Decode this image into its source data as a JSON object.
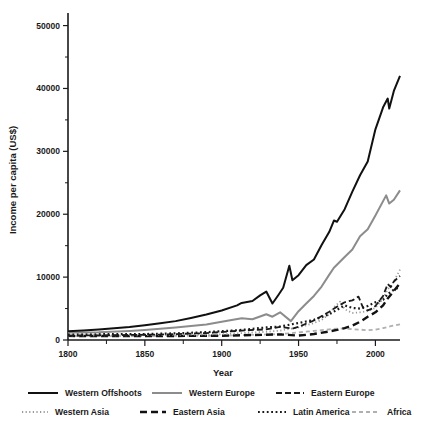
{
  "chart_data": {
    "type": "line",
    "title": "",
    "xlabel": "Year",
    "ylabel": "Income per capita (US$)",
    "xlim": [
      1800,
      2016
    ],
    "ylim": [
      0,
      52000
    ],
    "xticks": [
      1800,
      1850,
      1900,
      1950,
      2000
    ],
    "xtick_labels": [
      "1800",
      "1850",
      "1900",
      "1950",
      "2000"
    ],
    "xticks_minor": [
      1825,
      1875,
      1925,
      1975
    ],
    "yticks": [
      0,
      10000,
      20000,
      30000,
      40000,
      50000
    ],
    "ytick_labels": [
      "0",
      "10000",
      "20000",
      "30000",
      "40000",
      "50000"
    ],
    "yticks_minor": [
      5000,
      15000,
      25000,
      35000,
      45000
    ],
    "grid": false,
    "legend_position": "below",
    "series": [
      {
        "name": "Western Offshoots",
        "color": "#111111",
        "width": 2.0,
        "dash": "none",
        "x": [
          1800,
          1810,
          1820,
          1830,
          1840,
          1850,
          1860,
          1870,
          1880,
          1890,
          1900,
          1910,
          1913,
          1920,
          1925,
          1929,
          1933,
          1937,
          1940,
          1944,
          1946,
          1950,
          1955,
          1960,
          1965,
          1970,
          1973,
          1975,
          1980,
          1985,
          1990,
          1995,
          2000,
          2005,
          2008,
          2009,
          2012,
          2016
        ],
        "y": [
          1400,
          1500,
          1650,
          1850,
          2050,
          2350,
          2650,
          3000,
          3500,
          4050,
          4700,
          5500,
          5900,
          6200,
          7100,
          7700,
          5800,
          7200,
          8300,
          11800,
          9500,
          10300,
          11900,
          12800,
          15100,
          17200,
          19000,
          18800,
          20800,
          23600,
          26200,
          28400,
          33500,
          37000,
          38400,
          36800,
          39600,
          42000
        ]
      },
      {
        "name": "Western Europe",
        "color": "#8c8c8c",
        "width": 2.0,
        "dash": "none",
        "x": [
          1800,
          1820,
          1840,
          1850,
          1870,
          1890,
          1900,
          1913,
          1920,
          1929,
          1933,
          1938,
          1945,
          1950,
          1955,
          1960,
          1965,
          1970,
          1973,
          1980,
          1985,
          1990,
          1995,
          2000,
          2007,
          2009,
          2012,
          2016
        ],
        "y": [
          1200,
          1250,
          1450,
          1600,
          1980,
          2450,
          2900,
          3450,
          3300,
          4100,
          3700,
          4400,
          3000,
          4580,
          5800,
          7000,
          8500,
          10400,
          11500,
          13200,
          14400,
          16500,
          17600,
          19800,
          23000,
          21700,
          22300,
          23800
        ]
      },
      {
        "name": "Eastern Europe",
        "color": "#1a1a1a",
        "width": 1.8,
        "dash": "6,3",
        "x": [
          1800,
          1830,
          1860,
          1890,
          1913,
          1929,
          1938,
          1946,
          1950,
          1960,
          1970,
          1975,
          1980,
          1985,
          1989,
          1992,
          1995,
          1998,
          2000,
          2005,
          2008,
          2010,
          2012,
          2016
        ],
        "y": [
          700,
          760,
          870,
          1100,
          1500,
          1700,
          2100,
          1800,
          2100,
          3100,
          4500,
          5300,
          6000,
          6300,
          6900,
          5100,
          4700,
          5000,
          5400,
          7000,
          8900,
          8400,
          9300,
          10200
        ]
      },
      {
        "name": "Western Asia",
        "color": "#9a9a9a",
        "width": 1.8,
        "dash": "1.2,2.4",
        "x": [
          1800,
          1850,
          1900,
          1913,
          1929,
          1938,
          1950,
          1960,
          1965,
          1970,
          1973,
          1977,
          1980,
          1985,
          1990,
          1995,
          2000,
          2005,
          2008,
          2012,
          2016
        ],
        "y": [
          700,
          760,
          900,
          1100,
          1300,
          1500,
          2000,
          2700,
          3200,
          4100,
          5200,
          6100,
          4900,
          4300,
          4400,
          4600,
          5100,
          6600,
          8000,
          9300,
          11200
        ]
      },
      {
        "name": "Eastern Asia",
        "color": "#111111",
        "width": 2.4,
        "dash": "7,4",
        "x": [
          1800,
          1850,
          1900,
          1913,
          1929,
          1938,
          1950,
          1960,
          1970,
          1975,
          1980,
          1985,
          1990,
          1995,
          2000,
          2005,
          2008,
          2012,
          2016
        ],
        "y": [
          650,
          620,
          680,
          760,
          830,
          900,
          700,
          950,
          1350,
          1600,
          1900,
          2300,
          2900,
          3700,
          4400,
          5500,
          6600,
          7800,
          9000
        ]
      },
      {
        "name": "Latin America",
        "color": "#1a1a1a",
        "width": 2.2,
        "dash": "1.8,2.6",
        "x": [
          1800,
          1850,
          1870,
          1890,
          1913,
          1929,
          1938,
          1950,
          1960,
          1970,
          1975,
          1980,
          1985,
          1990,
          1995,
          2000,
          2005,
          2008,
          2012,
          2016
        ],
        "y": [
          900,
          950,
          1060,
          1250,
          1600,
          2000,
          2150,
          2700,
          3200,
          4100,
          4800,
          5500,
          5100,
          5000,
          5400,
          6000,
          6400,
          7300,
          8000,
          8400
        ]
      },
      {
        "name": "Africa",
        "color": "#b0b0b0",
        "width": 1.8,
        "dash": "4,3",
        "x": [
          1800,
          1850,
          1900,
          1913,
          1929,
          1938,
          1950,
          1960,
          1970,
          1975,
          1980,
          1985,
          1990,
          1995,
          2000,
          2005,
          2010,
          2016
        ],
        "y": [
          600,
          620,
          680,
          760,
          880,
          940,
          1200,
          1450,
          1700,
          1800,
          1850,
          1700,
          1650,
          1550,
          1650,
          1900,
          2200,
          2500
        ]
      }
    ]
  },
  "legend": {
    "rows": [
      [
        {
          "label": "Western Offshoots",
          "key": "western-offshoots"
        },
        {
          "label": "Western Europe",
          "key": "western-europe"
        },
        {
          "label": "Eastern Europe",
          "key": "eastern-europe"
        }
      ],
      [
        {
          "label": "Western Asia",
          "key": "western-asia"
        },
        {
          "label": "Eastern Asia",
          "key": "eastern-asia"
        },
        {
          "label": "Latin America",
          "key": "latin-america"
        },
        {
          "label": "Africa",
          "key": "africa"
        }
      ]
    ]
  }
}
